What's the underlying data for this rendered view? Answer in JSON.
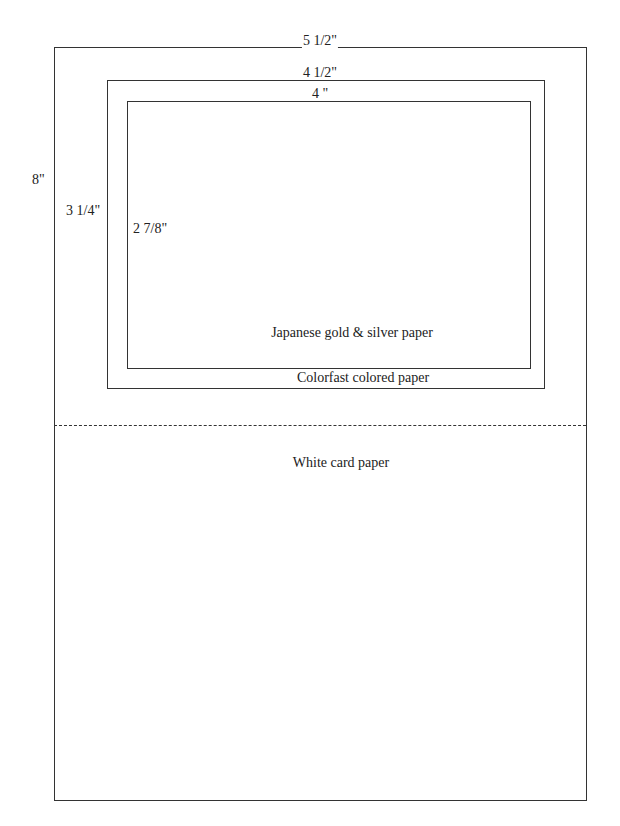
{
  "card": {
    "width_label": "5 1/2\"",
    "height_label": "8\"",
    "material": "White card paper"
  },
  "middle_layer": {
    "width_label": "4 1/2\"",
    "height_label": "3 1/4\"",
    "material": "Colorfast colored paper"
  },
  "inner_layer": {
    "width_label": "4 \"",
    "height_label": "2 7/8\"",
    "material": "Japanese gold & silver paper"
  },
  "fold_line": "dotted"
}
